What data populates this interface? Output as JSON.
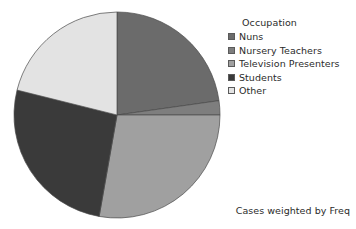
{
  "background_color": "#ffffff",
  "text_color": "#2b2b2b",
  "legend": {
    "title": "Occupation",
    "position": "right",
    "items": [
      {
        "label": "Nuns",
        "color": "#6b6b6b"
      },
      {
        "label": "Nursery Teachers",
        "color": "#7e7e7e"
      },
      {
        "label": "Television Presenters",
        "color": "#a0a0a0"
      },
      {
        "label": "Students",
        "color": "#3a3a3a"
      },
      {
        "label": "Other",
        "color": "#e3e3e3"
      }
    ]
  },
  "footnote": "Cases weighted by Freq",
  "chart_data": {
    "type": "pie",
    "title": "",
    "subtitle": "",
    "xlabel": "",
    "ylabel": "",
    "legend_title": "Occupation",
    "legend_position": "right",
    "grid": false,
    "start_angle_deg": 0,
    "direction": "clockwise",
    "center": {
      "x": 117,
      "y": 115
    },
    "radius": 103,
    "annotations": [
      "Cases weighted by Freq"
    ],
    "categories": [
      "Nuns",
      "Nursery Teachers",
      "Television Presenters",
      "Students",
      "Other"
    ],
    "values": [
      22.8,
      2.2,
      27.8,
      26.1,
      21.1
    ],
    "value_unit": "percent",
    "colors": [
      "#6b6b6b",
      "#7e7e7e",
      "#a0a0a0",
      "#3a3a3a",
      "#e3e3e3"
    ],
    "slices": [
      {
        "label": "Nuns",
        "percent": 22.8,
        "start_deg": 0,
        "end_deg": 82,
        "color": "#6b6b6b"
      },
      {
        "label": "Nursery Teachers",
        "percent": 2.2,
        "start_deg": 82,
        "end_deg": 90,
        "color": "#7e7e7e"
      },
      {
        "label": "Television Presenters",
        "percent": 27.8,
        "start_deg": 90,
        "end_deg": 190,
        "color": "#a0a0a0"
      },
      {
        "label": "Students",
        "percent": 26.1,
        "start_deg": 190,
        "end_deg": 284,
        "color": "#3a3a3a"
      },
      {
        "label": "Other",
        "percent": 21.1,
        "start_deg": 284,
        "end_deg": 360,
        "color": "#e3e3e3"
      }
    ]
  }
}
